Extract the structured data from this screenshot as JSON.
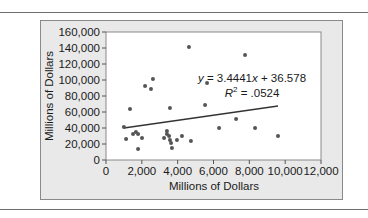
{
  "chart_data": {
    "type": "scatter",
    "title": "",
    "xlabel": "Millions of Dollars",
    "ylabel": "Millions of Dollars",
    "xlim": [
      0,
      12000
    ],
    "ylim": [
      0,
      160000
    ],
    "x_ticks": [
      "0",
      "2,000",
      "4,000",
      "6,000",
      "8,000",
      "10,000",
      "12,000"
    ],
    "y_ticks": [
      "0",
      "20,000",
      "40,000",
      "60,000",
      "80,000",
      "100,000",
      "120,000",
      "140,000",
      "160,000"
    ],
    "grid": false,
    "legend": null,
    "series": [
      {
        "name": "data",
        "points": [
          [
            1000,
            41250
          ],
          [
            1120,
            26250
          ],
          [
            1340,
            63750
          ],
          [
            1510,
            32500
          ],
          [
            1670,
            35000
          ],
          [
            1790,
            32500
          ],
          [
            2010,
            27500
          ],
          [
            1790,
            13750
          ],
          [
            2180,
            92500
          ],
          [
            2510,
            88750
          ],
          [
            2620,
            101250
          ],
          [
            3240,
            27500
          ],
          [
            3400,
            32500
          ],
          [
            3520,
            30000
          ],
          [
            3570,
            25000
          ],
          [
            3400,
            36250
          ],
          [
            3630,
            21250
          ],
          [
            3680,
            15000
          ],
          [
            3960,
            25000
          ],
          [
            3570,
            65000
          ],
          [
            4240,
            30000
          ],
          [
            4630,
            141250
          ],
          [
            4740,
            23750
          ],
          [
            5530,
            68750
          ],
          [
            5640,
            96250
          ],
          [
            6310,
            40000
          ],
          [
            7260,
            51250
          ],
          [
            7760,
            131250
          ],
          [
            8320,
            40000
          ],
          [
            9600,
            30000
          ]
        ]
      }
    ],
    "trendline": {
      "type": "linear",
      "x_range": [
        1000,
        9600
      ],
      "y_range": [
        40000,
        67500
      ],
      "equation": "y = 3.4441x + 36.578",
      "r_squared": "R² = .0524"
    },
    "annotations": [
      {
        "text_parts": [
          "y",
          " = 3.4441",
          "x",
          " + 36.578"
        ],
        "label": "equation"
      },
      {
        "text_parts": [
          "R",
          "2",
          " = .0524"
        ],
        "label": "r-squared"
      }
    ]
  }
}
